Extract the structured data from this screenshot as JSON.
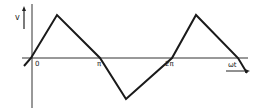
{
  "diagram": {
    "type": "waveform",
    "y_axis_label": "v",
    "x_axis_label": "ωt",
    "tick_labels": [
      {
        "text": "0",
        "x": 35,
        "y": 61
      },
      {
        "text": "π",
        "x": 97,
        "y": 61
      },
      {
        "text": "2π",
        "x": 165,
        "y": 61
      }
    ],
    "colors": {
      "line": "#1a1a1a",
      "axis": "#333333",
      "background": "#ffffff"
    },
    "waveform_points": [
      [
        24,
        66
      ],
      [
        31,
        58
      ],
      [
        57,
        15
      ],
      [
        100,
        58
      ],
      [
        126,
        99
      ],
      [
        172,
        58
      ],
      [
        196,
        15
      ],
      [
        238,
        58
      ],
      [
        247,
        73
      ]
    ]
  }
}
